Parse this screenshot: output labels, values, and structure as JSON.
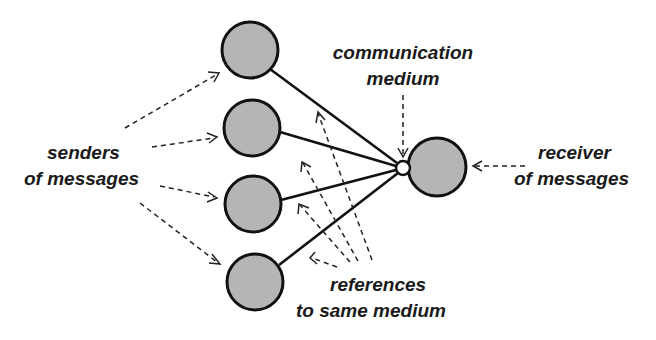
{
  "diagram": {
    "title": "",
    "labels": {
      "senders_line1": "senders",
      "senders_line2": "of messages",
      "medium_line1": "communication",
      "medium_line2": "medium",
      "receiver_line1": "receiver",
      "receiver_line2": "of messages",
      "refs_line1": "references",
      "refs_line2": "to same medium"
    },
    "nodes": [
      {
        "id": "sender-1",
        "role": "sender",
        "cx": 250,
        "cy": 50,
        "r": 28
      },
      {
        "id": "sender-2",
        "role": "sender",
        "cx": 252,
        "cy": 128,
        "r": 28
      },
      {
        "id": "sender-3",
        "role": "sender",
        "cx": 253,
        "cy": 204,
        "r": 28
      },
      {
        "id": "sender-4",
        "role": "sender",
        "cx": 255,
        "cy": 282,
        "r": 28
      },
      {
        "id": "medium",
        "role": "communication medium",
        "cx": 403,
        "cy": 168,
        "r": 7
      },
      {
        "id": "receiver",
        "role": "receiver",
        "cx": 437,
        "cy": 167,
        "r": 29
      }
    ],
    "edges": [
      {
        "from": "sender-1",
        "to": "medium",
        "style": "solid"
      },
      {
        "from": "sender-2",
        "to": "medium",
        "style": "solid"
      },
      {
        "from": "sender-3",
        "to": "medium",
        "style": "solid"
      },
      {
        "from": "sender-4",
        "to": "medium",
        "style": "solid"
      }
    ],
    "colors": {
      "node_fill": "#b5b5b5",
      "stroke": "#111111",
      "background": "#ffffff"
    }
  }
}
